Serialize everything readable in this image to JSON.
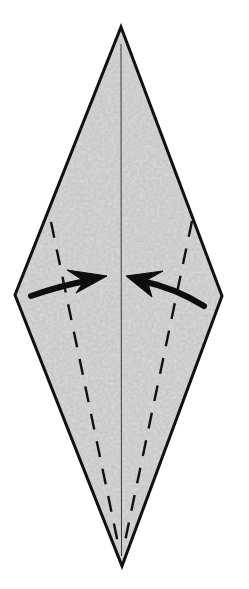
{
  "diagram": {
    "type": "origami-step",
    "colors": {
      "background": "#ffffff",
      "paper_fill": "#c9c9c9",
      "paper_speckle": "#b4b4b4",
      "outline": "#111111",
      "crease": "#333333",
      "fold_line": "#111111",
      "arrow": "#0d0d0d"
    },
    "shape": {
      "name": "diamond",
      "vertices": {
        "top": [
          121,
          27
        ],
        "right": [
          222,
          296
        ],
        "bottom": [
          122,
          566
        ],
        "left": [
          15,
          295
        ]
      },
      "outline_width": 3
    },
    "center_crease": {
      "from": [
        121,
        44
      ],
      "to": [
        121,
        556
      ],
      "width": 1
    },
    "valley_folds": [
      {
        "name": "left-valley-fold",
        "from": [
          51,
          222
        ],
        "to": [
          119,
          548
        ]
      },
      {
        "name": "right-valley-fold",
        "from": [
          192,
          221
        ],
        "to": [
          124,
          546
        ]
      }
    ],
    "arrows": [
      {
        "name": "left-fold-arrow",
        "direction": "right",
        "tail": [
          30,
          295
        ],
        "tip": [
          107,
          276
        ]
      },
      {
        "name": "right-fold-arrow",
        "direction": "left",
        "tail": [
          205,
          306
        ],
        "tip": [
          126,
          276
        ]
      }
    ]
  }
}
